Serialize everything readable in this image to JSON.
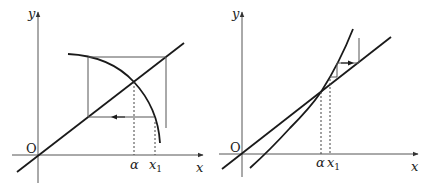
{
  "diagrams": [
    {
      "name": "decreasing-function-iteration",
      "axis_x_label": "x",
      "axis_y_label": "y",
      "origin_label": "O",
      "alpha_label": "α",
      "x1_label": "x",
      "x1_subscript": "1"
    },
    {
      "name": "increasing-function-iteration",
      "axis_x_label": "x",
      "axis_y_label": "y",
      "origin_label": "O",
      "alpha_label": "α",
      "x1_label": "x",
      "x1_subscript": "1"
    }
  ],
  "colors": {
    "stroke": "#1a1a1a",
    "axis": "#555555"
  }
}
